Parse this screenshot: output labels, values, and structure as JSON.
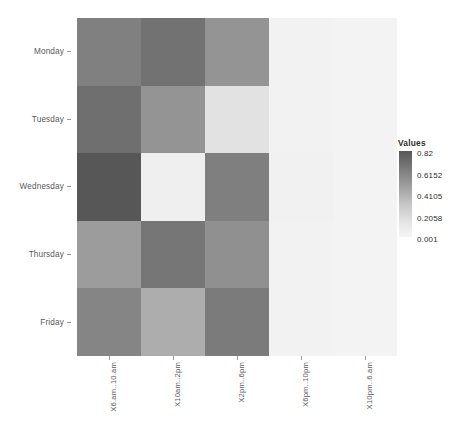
{
  "chart_data": {
    "type": "heatmap",
    "title": "",
    "xlabel": "",
    "ylabel": "",
    "grid": false,
    "legend_position": "right",
    "x_categories": [
      "X6.am..10.am",
      "X10am..2pm",
      "X2pm..6pm",
      "X6pm..10pm",
      "X10pm..6.am"
    ],
    "y_categories": [
      "Monday",
      "Tuesday",
      "Wednesday",
      "Thursday",
      "Friday"
    ],
    "values": [
      [
        0.5,
        0.62,
        0.4,
        0.03,
        0.02
      ],
      [
        0.65,
        0.4,
        0.12,
        0.03,
        0.02
      ],
      [
        0.82,
        0.05,
        0.52,
        0.03,
        0.02
      ],
      [
        0.35,
        0.6,
        0.42,
        0.03,
        0.02
      ],
      [
        0.48,
        0.3,
        0.55,
        0.03,
        0.02
      ]
    ],
    "cell_colors": [
      [
        "#808080",
        "#727272",
        "#949494",
        "#f2f2f2",
        "#f3f3f3"
      ],
      [
        "#6f6f6f",
        "#949494",
        "#e2e2e2",
        "#f2f2f2",
        "#f3f3f3"
      ],
      [
        "#575757",
        "#efefef",
        "#7f7f7f",
        "#f1f1f1",
        "#f3f3f3"
      ],
      [
        "#9c9c9c",
        "#767676",
        "#909090",
        "#f2f2f2",
        "#f3f3f3"
      ],
      [
        "#858585",
        "#adadad",
        "#7b7b7b",
        "#f2f2f2",
        "#f3f3f3"
      ]
    ],
    "zlim": [
      0.001,
      0.82
    ],
    "legend": {
      "title": "Values",
      "ticks": [
        "0.82",
        "0.6152",
        "0.4105",
        "0.2058",
        "0.001"
      ],
      "tick_values": [
        0.82,
        0.6152,
        0.4105,
        0.2058,
        0.001
      ],
      "gradient_high_color": "#575757",
      "gradient_low_color": "#f5f5f5"
    },
    "axis_label_color": "#5a5a5a",
    "background_color": "#ffffff"
  }
}
